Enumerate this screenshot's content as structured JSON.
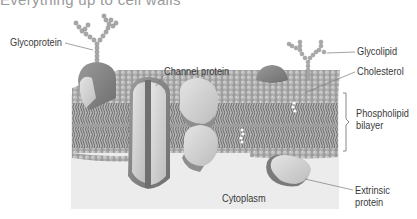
{
  "header": {
    "cropped_text": "Everything up to cell walls"
  },
  "diagram": {
    "labels": {
      "glycoprotein": "Glycoprotein",
      "channel_protein": "Channel protein",
      "glycolipid": "Glycolipid",
      "cholesterol": "Cholesterol",
      "phospholipid_bilayer_line1": "Phospholipid",
      "phospholipid_bilayer_line2": "bilayer",
      "cytoplasm": "Cytoplasm",
      "extrinsic_protein_line1": "Extrinsic",
      "extrinsic_protein_line2": "protein"
    },
    "colors": {
      "cytoplasm_bg": "#ececec",
      "membrane_beads": "#a9a9a9",
      "protein_light": "#d6d6d6",
      "protein_dark": "#7d7d7d",
      "tails": "#555555",
      "label_text": "#3a3a3a"
    }
  }
}
